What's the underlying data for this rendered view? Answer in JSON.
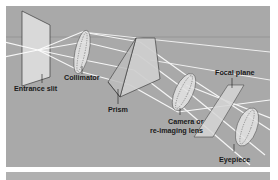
{
  "diagram": {
    "colors": {
      "background": "#a9a9a9",
      "beam": "#ffffff",
      "component_fill": "#d8d8d8",
      "outline": "#3a3a3a",
      "label": "#1a1a1a"
    },
    "components": [
      {
        "id": "entrance-slit",
        "label": "Entrance slit",
        "icon": "slit-plate"
      },
      {
        "id": "collimator",
        "label": "Collimator",
        "icon": "lens"
      },
      {
        "id": "prism",
        "label": "Prism",
        "icon": "prism"
      },
      {
        "id": "camera-lens",
        "label_line1": "Camera or",
        "label_line2": "re-imaging lens",
        "icon": "lens"
      },
      {
        "id": "focal-plane",
        "label": "Focal plane",
        "icon": "plane"
      },
      {
        "id": "eyepiece",
        "label": "Eyepiece",
        "icon": "lens"
      }
    ],
    "flow": [
      "Entrance slit",
      "Collimator",
      "Prism",
      "Camera or re-imaging lens",
      "Focal plane",
      "Eyepiece"
    ]
  }
}
